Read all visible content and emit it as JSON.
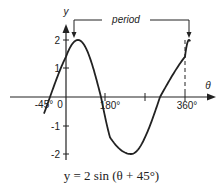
{
  "chart_data": {
    "type": "line",
    "title": "y = 2 sin (θ + 45°)",
    "xlabel": "θ",
    "ylabel": "y",
    "function": "2*sin(theta + 45deg)",
    "x_ticks": [
      {
        "value": -45,
        "label": "-45°"
      },
      {
        "value": 0,
        "label": "0"
      },
      {
        "value": 180,
        "label": "180°"
      },
      {
        "value": 270,
        "label": ""
      },
      {
        "value": 360,
        "label": "360°"
      }
    ],
    "y_ticks": [
      {
        "value": 2,
        "label": "2"
      },
      {
        "value": 1,
        "label": "1"
      },
      {
        "value": -1,
        "label": "-1"
      },
      {
        "value": -2,
        "label": "-2"
      }
    ],
    "ylim": [
      -2,
      2
    ],
    "xlim": [
      -60,
      400
    ],
    "series": [
      {
        "name": "y = 2 sin (θ + 45°)",
        "x": [
          -60,
          -45,
          0,
          45,
          135,
          225,
          315,
          405
        ],
        "values": [
          -0.52,
          0,
          1.41,
          2,
          0,
          -2,
          0,
          2
        ]
      }
    ],
    "key_points": {
      "zero_crossings": [
        -45,
        135,
        315
      ],
      "max": {
        "x": 45,
        "y": 2
      },
      "min": {
        "x": 225,
        "y": -2
      },
      "next_max": {
        "x": 405,
        "y": 2
      }
    },
    "annotations": [
      {
        "text": "period",
        "from": 45,
        "to": 405,
        "y": 2.3
      }
    ],
    "grid": false,
    "legend": "none"
  },
  "labels": {
    "y_axis": "y",
    "x_axis": "θ",
    "period": "period",
    "tick_neg45": "-45°",
    "tick_0": "0",
    "tick_180": "180°",
    "tick_360": "360°",
    "ytick_2": "2",
    "ytick_1": "1",
    "ytick_m1": "-1",
    "ytick_m2": "-2"
  },
  "caption": "y = 2 sin (θ + 45°)"
}
